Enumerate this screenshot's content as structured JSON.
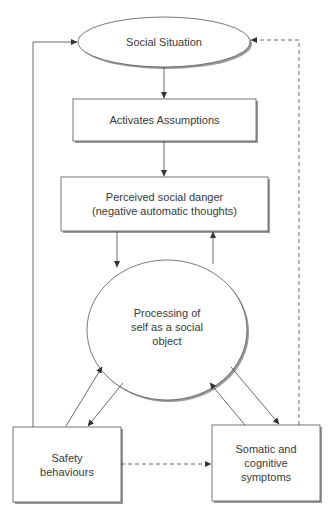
{
  "diagram": {
    "nodes": [
      {
        "id": "social_situation",
        "shape": "ellipse",
        "label": "Social Situation"
      },
      {
        "id": "activates_assumptions",
        "shape": "box",
        "label": "Activates Assumptions"
      },
      {
        "id": "perceived_danger",
        "shape": "box",
        "label_line1": "Perceived social danger",
        "label_line2": "(negative automatic thoughts)"
      },
      {
        "id": "processing_self",
        "shape": "ellipse",
        "label_line1": "Processing of",
        "label_line2": "self as a social",
        "label_line3": "object"
      },
      {
        "id": "safety_behaviours",
        "shape": "box",
        "label_line1": "Safety",
        "label_line2": "behaviours"
      },
      {
        "id": "somatic_symptoms",
        "shape": "box",
        "label_line1": "Somatic and",
        "label_line2": "cognitive",
        "label_line3": "symptoms"
      }
    ],
    "edges": [
      {
        "from": "social_situation",
        "to": "activates_assumptions",
        "style": "solid"
      },
      {
        "from": "activates_assumptions",
        "to": "perceived_danger",
        "style": "solid"
      },
      {
        "from": "perceived_danger",
        "to": "processing_self",
        "style": "solid"
      },
      {
        "from": "processing_self",
        "to": "perceived_danger",
        "style": "solid"
      },
      {
        "from": "processing_self",
        "to": "safety_behaviours",
        "style": "solid"
      },
      {
        "from": "safety_behaviours",
        "to": "processing_self",
        "style": "solid"
      },
      {
        "from": "processing_self",
        "to": "somatic_symptoms",
        "style": "solid"
      },
      {
        "from": "somatic_symptoms",
        "to": "processing_self",
        "style": "solid"
      },
      {
        "from": "safety_behaviours",
        "to": "social_situation",
        "style": "solid"
      },
      {
        "from": "somatic_symptoms",
        "to": "social_situation",
        "style": "dashed"
      },
      {
        "from": "safety_behaviours",
        "to": "somatic_symptoms",
        "style": "dashed"
      }
    ],
    "colors": {
      "stroke": "#444444",
      "shadow": "#9a9a9a",
      "text": "#3a3a3a"
    }
  }
}
